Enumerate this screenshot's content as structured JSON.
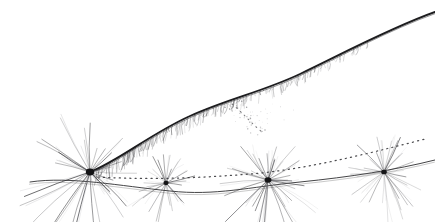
{
  "artwork": {
    "title": "Pen and ink botanical line drawing",
    "subject": "arching stem with four seed-head flowers",
    "medium": "ink line drawing",
    "background_color": "#ffffff",
    "ink_color": "#1d1d1f",
    "canvas": {
      "width": 435,
      "height": 222
    },
    "elements": {
      "main_stem_label": "main arching stem",
      "dotted_stem_label": "dotted trailing stem",
      "lower_stem_label": "lower solid stem",
      "spray_label": "fine dotted spray",
      "flower_label": "seed head"
    },
    "flowers": [
      {
        "name": "seed-head-1",
        "cx": 90,
        "cy": 172,
        "radius": 46,
        "rays": 30,
        "weight": 1.0,
        "core": 4.2
      },
      {
        "name": "seed-head-2",
        "cx": 166,
        "cy": 183,
        "radius": 30,
        "rays": 26,
        "weight": 0.72,
        "core": 2.6
      },
      {
        "name": "seed-head-3",
        "cx": 268,
        "cy": 180,
        "radius": 42,
        "rays": 34,
        "weight": 0.9,
        "core": 3.4
      },
      {
        "name": "seed-head-4",
        "cx": 384,
        "cy": 172,
        "radius": 36,
        "rays": 30,
        "weight": 0.68,
        "core": 2.8
      }
    ],
    "paths": {
      "main_stem": "M 90,172 C 120,160 150,134 190,116 C 230,98 262,92 300,74 C 340,55 390,28 435,12",
      "dotted_stem": "M 98,177 C 150,180 200,178 250,174 C 300,170 360,156 425,139",
      "lower_stem": "M 30,182 C 70,176 120,186 170,191 C 215,196 250,187 300,182 C 350,177 395,170 435,160",
      "spray": "M 232,104 C 244,114 252,124 262,132"
    }
  }
}
